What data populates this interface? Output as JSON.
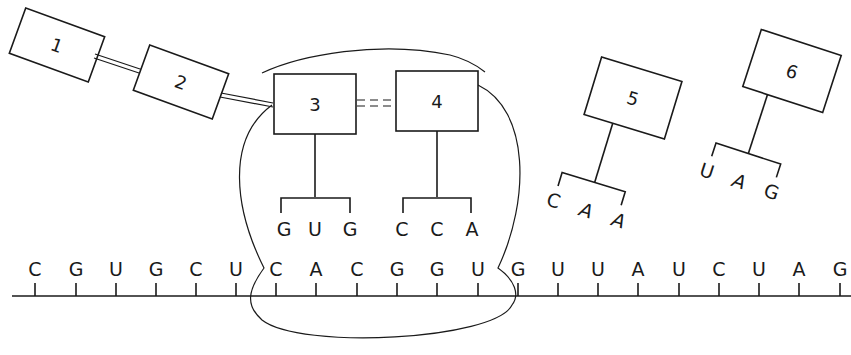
{
  "diagram": {
    "type": "translation",
    "mrna": {
      "bases": [
        "C",
        "G",
        "U",
        "G",
        "C",
        "U",
        "C",
        "A",
        "C",
        "G",
        "G",
        "U",
        "G",
        "U",
        "U",
        "A",
        "U",
        "C",
        "U",
        "A",
        "G"
      ],
      "x_positions": [
        35,
        76,
        116,
        156,
        196,
        236,
        276,
        316,
        357,
        397,
        437,
        478,
        518,
        558,
        598,
        638,
        679,
        719,
        759,
        799,
        840
      ]
    },
    "trnas": [
      {
        "label": "1",
        "anticodon": []
      },
      {
        "label": "2",
        "anticodon": []
      },
      {
        "label": "3",
        "anticodon": [
          "G",
          "U",
          "G"
        ]
      },
      {
        "label": "4",
        "anticodon": [
          "C",
          "C",
          "A"
        ]
      },
      {
        "label": "5",
        "anticodon": [
          "C",
          "A",
          "A"
        ]
      },
      {
        "label": "6",
        "anticodon": [
          "U",
          "A",
          "G"
        ]
      }
    ],
    "ribosome": {
      "label": ""
    }
  }
}
